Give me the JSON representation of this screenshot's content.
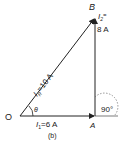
{
  "diagram": {
    "points": {
      "O": "O",
      "A": "A",
      "B": "B"
    },
    "vectors": {
      "i1": {
        "symbol": "I",
        "sub": "1",
        "value": "=6 A"
      },
      "i2": {
        "symbol": "I",
        "sub": "2",
        "eq": "=",
        "value": "8 A"
      },
      "ir": {
        "symbol": "I",
        "sub": "R",
        "value": "=10 A"
      }
    },
    "angle_theta": "θ",
    "angle_right": "90°",
    "caption": "(b)"
  }
}
